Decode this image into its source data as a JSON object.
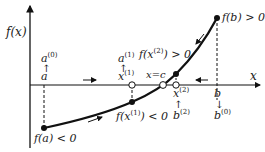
{
  "diagram": {
    "axes": {
      "y_label": "f(x)",
      "x_label": "x"
    },
    "labels": {
      "a0": "a",
      "a0_sup": "(0)",
      "a_lower": "a",
      "x1_upper": "a",
      "x1_upper_sup": "(1)",
      "x1": "x",
      "x1_sup": "(1)",
      "fx2": "f(x",
      "fx2_sup": "(2)",
      "fx2_tail": ") > 0",
      "fb": "f(b) > 0",
      "xc": "x=c",
      "x2": "x",
      "x2_sup": "(2)",
      "b2": "b",
      "b2_sup": "(2)",
      "b_upper": "b",
      "b0": "b",
      "b0_sup": "(0)",
      "fa": "f(a) < 0",
      "fx1": "f(x",
      "fx1_sup": "(1)",
      "fx1_tail": ") < 0"
    },
    "arrows": {
      "up": "↑",
      "down": "↓"
    },
    "colors": {
      "line": "#111111",
      "text": "#222222"
    }
  }
}
